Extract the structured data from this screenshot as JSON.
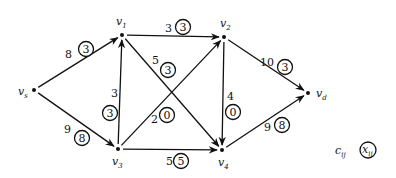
{
  "nodes": [
    {
      "id": "vs",
      "label": "v",
      "sub": "s",
      "x": 34,
      "y": 90,
      "lx": 18,
      "ly": 95
    },
    {
      "id": "v1",
      "label": "v",
      "sub": "1",
      "x": 122,
      "y": 35,
      "lx": 116,
      "ly": 25
    },
    {
      "id": "v2",
      "label": "v",
      "sub": "2",
      "x": 224,
      "y": 37,
      "lx": 220,
      "ly": 27
    },
    {
      "id": "v3",
      "label": "v",
      "sub": "3",
      "x": 118,
      "y": 149,
      "lx": 112,
      "ly": 165
    },
    {
      "id": "v4",
      "label": "v",
      "sub": "4",
      "x": 222,
      "y": 150,
      "lx": 218,
      "ly": 166
    },
    {
      "id": "vd",
      "label": "v",
      "sub": "d",
      "x": 308,
      "y": 93,
      "lx": 316,
      "ly": 97
    }
  ],
  "edges": [
    {
      "from": "vs",
      "to": "v1",
      "capacity": "8",
      "flow": "3",
      "cx": 65,
      "cy": 58,
      "fx": 86,
      "fy": 49
    },
    {
      "from": "vs",
      "to": "v3",
      "capacity": "9",
      "flow": "8",
      "cx": 64,
      "cy": 133,
      "fx": 82,
      "fy": 138
    },
    {
      "from": "v1",
      "to": "v2",
      "capacity": "3",
      "flow": "3",
      "cx": 165,
      "cy": 32,
      "fx": 183,
      "fy": 27
    },
    {
      "from": "v1",
      "to": "v4",
      "capacity": "5",
      "flow": "3",
      "cx": 152,
      "cy": 64,
      "fx": 168,
      "fy": 70
    },
    {
      "from": "v3",
      "to": "v1",
      "capacity": "3",
      "flow": "3",
      "cx": 111,
      "cy": 97,
      "fx": 110,
      "fy": 113
    },
    {
      "from": "v3",
      "to": "v2",
      "capacity": "2",
      "flow": "0",
      "cx": 151,
      "cy": 123,
      "fx": 167,
      "fy": 115
    },
    {
      "from": "v3",
      "to": "v4",
      "capacity": "5",
      "flow": "5",
      "cx": 166,
      "cy": 165,
      "fx": 181,
      "fy": 161
    },
    {
      "from": "v2",
      "to": "v4",
      "capacity": "4",
      "flow": "0",
      "cx": 227,
      "cy": 100,
      "fx": 233,
      "fy": 112
    },
    {
      "from": "v2",
      "to": "vd",
      "capacity": "10",
      "flow": "3",
      "cx": 260,
      "cy": 66,
      "fx": 285,
      "fy": 67
    },
    {
      "from": "v4",
      "to": "vd",
      "capacity": "9",
      "flow": "8",
      "cx": 264,
      "cy": 131,
      "fx": 282,
      "fy": 125
    }
  ],
  "legend": {
    "capacity_label": "c",
    "capacity_sub": "ij",
    "flow_label": "x",
    "flow_sub": "ij"
  }
}
